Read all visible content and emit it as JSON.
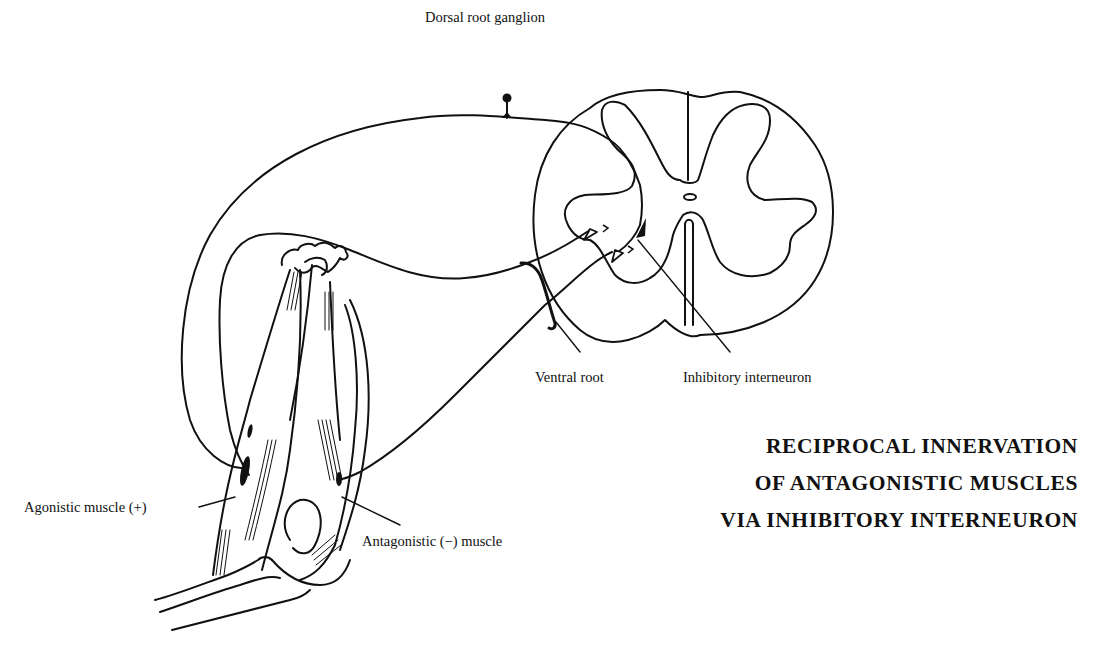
{
  "diagram": {
    "title_lines": [
      "RECIPROCAL INNERVATION",
      "OF ANTAGONISTIC MUSCLES",
      "VIA INHIBITORY INTERNEURON"
    ],
    "labels": {
      "dorsal_root_ganglion": "Dorsal root ganglion",
      "ventral_root": "Ventral root",
      "inhibitory_interneuron": "Inhibitory interneuron",
      "agonistic_muscle": "Agonistic muscle (+)",
      "antagonistic_muscle": "Antagonistic (−) muscle"
    },
    "colors": {
      "ink": "#111111",
      "background": "#ffffff"
    }
  }
}
